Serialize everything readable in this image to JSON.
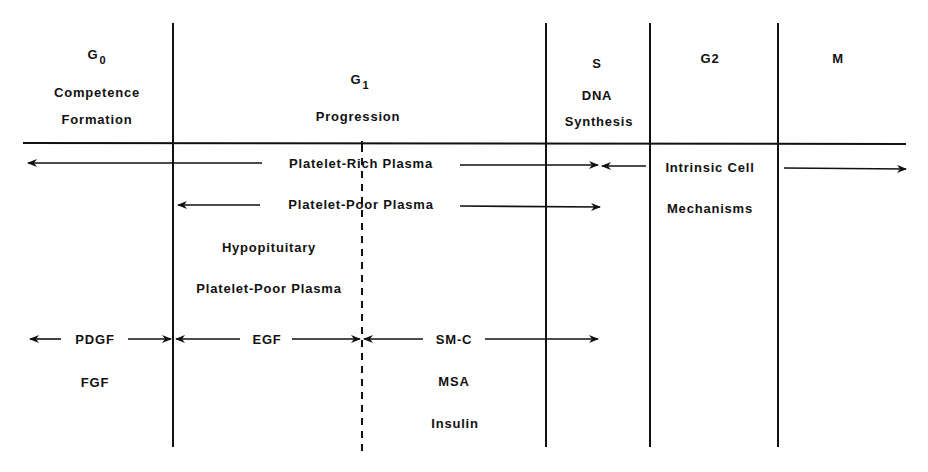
{
  "diagram": {
    "type": "cell-cycle-growth-factor-diagram",
    "phases": [
      {
        "id": "g0",
        "symbol": "G",
        "subscript": "0",
        "line1": "Competence",
        "line2": "Formation"
      },
      {
        "id": "g1",
        "symbol": "G",
        "subscript": "1",
        "line1": "Progression",
        "line2": ""
      },
      {
        "id": "s",
        "symbol": "S",
        "subscript": "",
        "line1": "DNA",
        "line2": "Synthesis"
      },
      {
        "id": "g2",
        "symbol": "G2",
        "subscript": "",
        "line1": "",
        "line2": ""
      },
      {
        "id": "m",
        "symbol": "M",
        "subscript": "",
        "line1": "",
        "line2": ""
      }
    ],
    "factors": {
      "platelet_rich_plasma": "Platelet-Rich Plasma",
      "platelet_poor_plasma": "Platelet-Poor Plasma",
      "intrinsic_line1": "Intrinsic Cell",
      "intrinsic_line2": "Mechanisms",
      "hypopituitary_line1": "Hypopituitary",
      "hypopituitary_line2": "Platelet-Poor Plasma",
      "pdgf": "PDGF",
      "fgf": "FGF",
      "egf": "EGF",
      "smc": "SM-C",
      "msa": "MSA",
      "insulin": "Insulin"
    },
    "colors": {
      "ink": "#111111",
      "background": "#ffffff"
    }
  }
}
